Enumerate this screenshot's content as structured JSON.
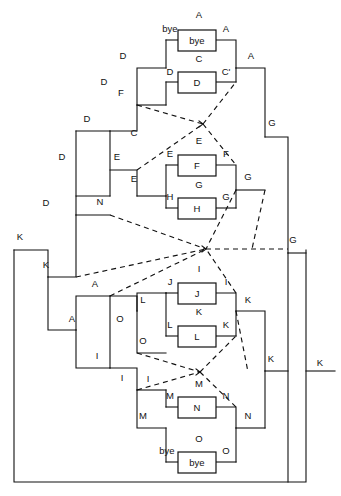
{
  "diagram": {
    "type": "node-link-schematic",
    "canvas": {
      "width": 341,
      "height": 496,
      "background": "#ffffff"
    },
    "stroke_color": "#111111",
    "boxes": [
      {
        "id": "bye-top",
        "label": "bye",
        "x": 178,
        "y": 30,
        "w": 38,
        "h": 21,
        "top_label": "A",
        "left_label": "bye",
        "right_label": "A"
      },
      {
        "id": "box-d",
        "label": "D",
        "x": 178,
        "y": 72,
        "w": 38,
        "h": 21,
        "top_label": "C",
        "left_label": "D",
        "right_label": "C'"
      },
      {
        "id": "box-f",
        "label": "F",
        "x": 178,
        "y": 155,
        "w": 38,
        "h": 21,
        "top_label": "E",
        "left_label": "E",
        "right_label": "F"
      },
      {
        "id": "box-h",
        "label": "H",
        "x": 178,
        "y": 198,
        "w": 38,
        "h": 21,
        "top_label": "G",
        "left_label": "H",
        "right_label": "G"
      },
      {
        "id": "box-j",
        "label": "J",
        "x": 178,
        "y": 283,
        "w": 38,
        "h": 21,
        "top_label": "I",
        "left_label": "J",
        "right_label": "I"
      },
      {
        "id": "box-l",
        "label": "L",
        "x": 178,
        "y": 326,
        "w": 38,
        "h": 21,
        "top_label": "K",
        "left_label": "L",
        "right_label": "K"
      },
      {
        "id": "box-n",
        "label": "N",
        "x": 178,
        "y": 397,
        "w": 38,
        "h": 21,
        "top_label": "M",
        "left_label": "M",
        "right_label": "N"
      },
      {
        "id": "bye-bot",
        "label": "bye",
        "x": 178,
        "y": 452,
        "w": 38,
        "h": 21,
        "top_label": "O",
        "left_label": "bye",
        "right_label": "O"
      }
    ],
    "wire_labels": [
      {
        "id": "w-a-top",
        "text": "A",
        "x": 199,
        "y": 18
      },
      {
        "id": "w-bye-left",
        "text": "bye",
        "x": 170,
        "y": 32
      },
      {
        "id": "w-a-r1",
        "text": "A",
        "x": 226,
        "y": 32
      },
      {
        "id": "w-a-r2",
        "text": "A",
        "x": 251,
        "y": 59
      },
      {
        "id": "w-d-1",
        "text": "D",
        "x": 123,
        "y": 59
      },
      {
        "id": "w-d-2",
        "text": "D",
        "x": 104,
        "y": 85
      },
      {
        "id": "w-c-top",
        "text": "C",
        "x": 199,
        "y": 62
      },
      {
        "id": "w-d-boxleft",
        "text": "D",
        "x": 170,
        "y": 75
      },
      {
        "id": "w-cprime",
        "text": "C'",
        "x": 226,
        "y": 75
      },
      {
        "id": "w-f-1",
        "text": "F",
        "x": 121,
        "y": 96
      },
      {
        "id": "w-d-3",
        "text": "D",
        "x": 87,
        "y": 122
      },
      {
        "id": "w-d-4",
        "text": "D",
        "x": 62,
        "y": 160
      },
      {
        "id": "w-d-5",
        "text": "D",
        "x": 46,
        "y": 206
      },
      {
        "id": "w-k-1",
        "text": "K",
        "x": 20,
        "y": 240
      },
      {
        "id": "w-k-2",
        "text": "K",
        "x": 46,
        "y": 268
      },
      {
        "id": "w-c-2",
        "text": "C",
        "x": 134,
        "y": 136
      },
      {
        "id": "w-e-1",
        "text": "E",
        "x": 117,
        "y": 160
      },
      {
        "id": "w-e-2",
        "text": "E",
        "x": 134,
        "y": 182
      },
      {
        "id": "w-e-top",
        "text": "E",
        "x": 199,
        "y": 144
      },
      {
        "id": "w-e-boxleft",
        "text": "E",
        "x": 170,
        "y": 157
      },
      {
        "id": "w-f-r",
        "text": "F",
        "x": 226,
        "y": 157
      },
      {
        "id": "w-g-top",
        "text": "G",
        "x": 199,
        "y": 188
      },
      {
        "id": "w-h-boxleft",
        "text": "H",
        "x": 170,
        "y": 200
      },
      {
        "id": "w-g-r1",
        "text": "G",
        "x": 226,
        "y": 200
      },
      {
        "id": "w-g-r2",
        "text": "G",
        "x": 248,
        "y": 180
      },
      {
        "id": "w-g-r3",
        "text": "G",
        "x": 272,
        "y": 126
      },
      {
        "id": "w-g-r4",
        "text": "G",
        "x": 293,
        "y": 243
      },
      {
        "id": "w-n-1",
        "text": "N",
        "x": 100,
        "y": 205
      },
      {
        "id": "w-a-l1",
        "text": "A",
        "x": 95,
        "y": 287
      },
      {
        "id": "w-a-l2",
        "text": "A",
        "x": 72,
        "y": 322
      },
      {
        "id": "w-i-l1",
        "text": "I",
        "x": 97,
        "y": 359
      },
      {
        "id": "w-i-l2",
        "text": "I",
        "x": 122,
        "y": 381
      },
      {
        "id": "w-o-1",
        "text": "O",
        "x": 120,
        "y": 322
      },
      {
        "id": "w-o-2",
        "text": "O",
        "x": 143,
        "y": 344
      },
      {
        "id": "w-l-1",
        "text": "L",
        "x": 143,
        "y": 303
      },
      {
        "id": "w-j-boxleft",
        "text": "J",
        "x": 170,
        "y": 285
      },
      {
        "id": "w-i-top",
        "text": "I",
        "x": 199,
        "y": 272
      },
      {
        "id": "w-i-r",
        "text": "I",
        "x": 226,
        "y": 285
      },
      {
        "id": "w-k-top",
        "text": "K",
        "x": 199,
        "y": 315
      },
      {
        "id": "w-l-boxleft",
        "text": "L",
        "x": 170,
        "y": 328
      },
      {
        "id": "w-kprime",
        "text": "K",
        "x": 226,
        "y": 328
      },
      {
        "id": "w-k-r1",
        "text": "K",
        "x": 248,
        "y": 303
      },
      {
        "id": "w-k-r2",
        "text": "K",
        "x": 271,
        "y": 362
      },
      {
        "id": "w-k-r3",
        "text": "K",
        "x": 320,
        "y": 366
      },
      {
        "id": "w-i-m",
        "text": "I",
        "x": 148,
        "y": 382
      },
      {
        "id": "w-m-top",
        "text": "M",
        "x": 199,
        "y": 387
      },
      {
        "id": "w-m-boxleft",
        "text": "M",
        "x": 170,
        "y": 399
      },
      {
        "id": "w-n-r1",
        "text": "N",
        "x": 226,
        "y": 399
      },
      {
        "id": "w-m-l",
        "text": "M",
        "x": 143,
        "y": 419
      },
      {
        "id": "w-n-r2",
        "text": "N",
        "x": 248,
        "y": 419
      },
      {
        "id": "w-o-top",
        "text": "O",
        "x": 199,
        "y": 442
      },
      {
        "id": "w-bye-botl",
        "text": "bye",
        "x": 167,
        "y": 454
      },
      {
        "id": "w-o-r",
        "text": "O",
        "x": 226,
        "y": 454
      }
    ],
    "crossover_hubs": [
      {
        "id": "hub-upper",
        "x": 203,
        "y": 124
      },
      {
        "id": "hub-center",
        "x": 206,
        "y": 249
      },
      {
        "id": "hub-lower",
        "x": 200,
        "y": 372
      }
    ],
    "legend": {
      "solid": "direct wire",
      "dashed": "crossover / feedback wire"
    }
  }
}
